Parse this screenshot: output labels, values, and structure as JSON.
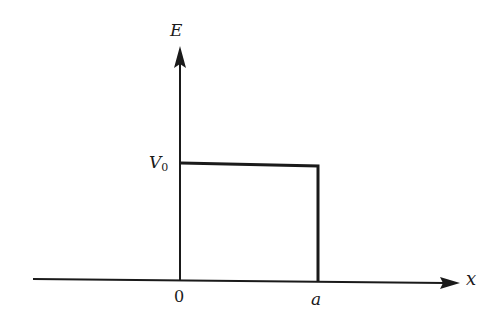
{
  "diagram": {
    "type": "potential-barrier",
    "axes": {
      "y_label": "E",
      "x_label": "x"
    },
    "labels": {
      "barrier_height_main": "V",
      "barrier_height_sub": "0",
      "origin": "0",
      "barrier_end": "a"
    },
    "colors": {
      "stroke": "#1a1a1a",
      "background": "#ffffff"
    }
  }
}
